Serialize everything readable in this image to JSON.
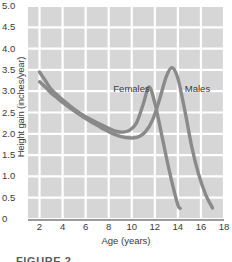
{
  "figure": {
    "caption": "FIGURE 2"
  },
  "chart_data": {
    "type": "line",
    "title": "",
    "xlabel": "Age (years)",
    "ylabel": "Height gain (inches/year)",
    "xlim": [
      1,
      18
    ],
    "ylim": [
      0,
      5.0
    ],
    "grid": true,
    "grid_color": "#ffffff",
    "plot_background": "#d6d6d6",
    "line_color": "#8a8a8a",
    "legend_position": "inline-annotation",
    "xticks": [
      2,
      4,
      6,
      8,
      10,
      12,
      14,
      16,
      18
    ],
    "xtick_labels": [
      "2",
      "4",
      "6",
      "8",
      "10",
      "12",
      "14",
      "16",
      "18"
    ],
    "yticks": [
      0,
      0.5,
      1.0,
      1.5,
      2.0,
      2.5,
      3.0,
      3.5,
      4.0,
      4.5,
      5.0
    ],
    "ytick_labels": [
      "0",
      "0.5",
      "1.0",
      "1.5",
      "2.0",
      "2.5",
      "3.0",
      "3.5",
      "4.0",
      "4.5",
      "5.0"
    ],
    "annotations": [
      {
        "text": "Females",
        "x": 8.4,
        "y": 3.05
      },
      {
        "text": "Males",
        "x": 14.6,
        "y": 3.05
      }
    ],
    "series": [
      {
        "name": "Females",
        "x": [
          2.0,
          2.5,
          3.0,
          3.5,
          4.0,
          5.0,
          6.0,
          7.0,
          8.0,
          8.6,
          9.2,
          9.8,
          10.4,
          11.0,
          11.5,
          12.0,
          12.5,
          13.0,
          13.5,
          14.0,
          14.2
        ],
        "values": [
          3.45,
          3.25,
          3.05,
          2.92,
          2.8,
          2.58,
          2.4,
          2.26,
          2.13,
          2.06,
          2.04,
          2.08,
          2.25,
          2.7,
          3.1,
          2.72,
          2.1,
          1.45,
          0.85,
          0.33,
          0.25
        ]
      },
      {
        "name": "Males",
        "x": [
          2.0,
          2.5,
          3.0,
          3.5,
          4.0,
          5.0,
          6.0,
          7.0,
          8.0,
          9.0,
          10.0,
          10.6,
          11.2,
          11.8,
          12.4,
          13.0,
          13.5,
          14.0,
          14.6,
          15.2,
          15.8,
          16.4,
          17.0
        ],
        "values": [
          3.22,
          3.1,
          2.96,
          2.85,
          2.74,
          2.54,
          2.36,
          2.2,
          2.05,
          1.94,
          1.9,
          1.93,
          2.05,
          2.32,
          2.8,
          3.35,
          3.55,
          3.3,
          2.55,
          1.7,
          1.05,
          0.58,
          0.26
        ]
      }
    ]
  }
}
